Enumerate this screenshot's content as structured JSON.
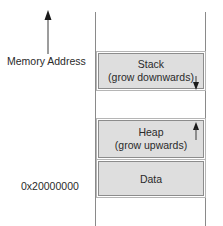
{
  "axis": {
    "label": "Memory Address",
    "base_address": "0x20000000",
    "direction": "up"
  },
  "segments": [
    {
      "name": "Stack",
      "note": "(grow downwards)",
      "growth": "down"
    },
    {
      "name": "Heap",
      "note": "(grow upwards)",
      "growth": "up"
    },
    {
      "name": "Data",
      "note": "",
      "growth": "none"
    }
  ],
  "colors": {
    "segment_fill": "#dedede",
    "segment_border": "#8c8c8c",
    "line": "#8a8a8a",
    "arrow": "#1a1a1a"
  }
}
